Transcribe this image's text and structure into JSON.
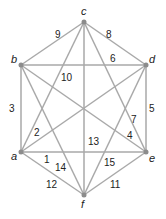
{
  "graph": {
    "type": "complete-graph-K6",
    "vertices": [
      {
        "id": "a",
        "label": "a",
        "x": 21,
        "y": 152
      },
      {
        "id": "b",
        "label": "b",
        "x": 21,
        "y": 65
      },
      {
        "id": "c",
        "label": "c",
        "x": 84,
        "y": 22
      },
      {
        "id": "d",
        "label": "d",
        "x": 146,
        "y": 65
      },
      {
        "id": "e",
        "label": "e",
        "x": 146,
        "y": 152
      },
      {
        "id": "f",
        "label": "f",
        "x": 84,
        "y": 195
      }
    ],
    "edges": [
      {
        "from": "a",
        "to": "e",
        "weight": "1"
      },
      {
        "from": "a",
        "to": "d",
        "weight": "2"
      },
      {
        "from": "a",
        "to": "b",
        "weight": "3"
      },
      {
        "from": "b",
        "to": "e",
        "weight": "4"
      },
      {
        "from": "d",
        "to": "e",
        "weight": "5"
      },
      {
        "from": "b",
        "to": "d",
        "weight": "6"
      },
      {
        "from": "c",
        "to": "e",
        "weight": "7"
      },
      {
        "from": "c",
        "to": "d",
        "weight": "8"
      },
      {
        "from": "b",
        "to": "c",
        "weight": "9"
      },
      {
        "from": "c",
        "to": "a",
        "weight": "10"
      },
      {
        "from": "e",
        "to": "f",
        "weight": "11"
      },
      {
        "from": "a",
        "to": "f",
        "weight": "12"
      },
      {
        "from": "c",
        "to": "f",
        "weight": "13"
      },
      {
        "from": "b",
        "to": "f",
        "weight": "14"
      },
      {
        "from": "d",
        "to": "f",
        "weight": "15"
      }
    ]
  }
}
